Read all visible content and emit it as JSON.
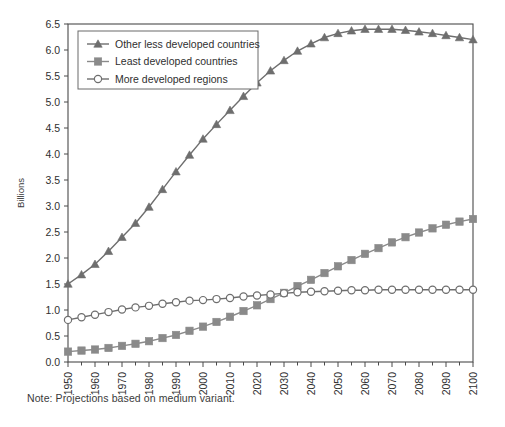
{
  "figure": {
    "note": "Note: Projections based on medium variant.",
    "ylabel": "Billions"
  },
  "legend": {
    "position": "top-left-inside",
    "entries": [
      {
        "label": "Other less developed countries",
        "marker": "triangle",
        "color": "#6e6e6e"
      },
      {
        "label": "Least developed countries",
        "marker": "square",
        "color": "#8a8a8a"
      },
      {
        "label": "More developed regions",
        "marker": "circle-open",
        "color": "#6e6e6e"
      }
    ]
  },
  "axes": {
    "y_ticks": [
      "0.0",
      "0.5",
      "1.0",
      "1.5",
      "2.0",
      "2.5",
      "3.0",
      "3.5",
      "4.0",
      "4.5",
      "5.0",
      "5.5",
      "6.0",
      "6.5"
    ],
    "x_ticks": [
      "1950",
      "1960",
      "1970",
      "1980",
      "1990",
      "2000",
      "2010",
      "2020",
      "2030",
      "2040",
      "2050",
      "2060",
      "2070",
      "2080",
      "2090",
      "2100"
    ]
  },
  "chart_data": {
    "type": "line",
    "title": "",
    "xlabel": "",
    "ylabel": "Billions",
    "xlim": [
      1950,
      2100
    ],
    "ylim": [
      0.0,
      6.5
    ],
    "grid": false,
    "legend_position": "upper left",
    "x": [
      1950,
      1955,
      1960,
      1965,
      1970,
      1975,
      1980,
      1985,
      1990,
      1995,
      2000,
      2005,
      2010,
      2015,
      2020,
      2025,
      2030,
      2035,
      2040,
      2045,
      2050,
      2055,
      2060,
      2065,
      2070,
      2075,
      2080,
      2085,
      2090,
      2095,
      2100
    ],
    "series": [
      {
        "name": "Other less developed countries",
        "marker": "triangle",
        "color": "#6e6e6e",
        "values": [
          1.5,
          1.68,
          1.88,
          2.13,
          2.4,
          2.67,
          2.98,
          3.32,
          3.66,
          3.98,
          4.29,
          4.57,
          4.84,
          5.11,
          5.37,
          5.6,
          5.8,
          5.98,
          6.12,
          6.24,
          6.32,
          6.37,
          6.4,
          6.4,
          6.4,
          6.38,
          6.35,
          6.32,
          6.28,
          6.24,
          6.2
        ]
      },
      {
        "name": "Least developed countries",
        "marker": "square",
        "color": "#8a8a8a",
        "values": [
          0.2,
          0.22,
          0.24,
          0.27,
          0.31,
          0.35,
          0.4,
          0.46,
          0.52,
          0.6,
          0.68,
          0.77,
          0.87,
          0.98,
          1.09,
          1.21,
          1.33,
          1.46,
          1.58,
          1.71,
          1.84,
          1.96,
          2.08,
          2.19,
          2.3,
          2.4,
          2.49,
          2.57,
          2.64,
          2.7,
          2.75
        ]
      },
      {
        "name": "More developed regions",
        "marker": "circle-open",
        "color": "#6e6e6e",
        "values": [
          0.81,
          0.86,
          0.91,
          0.96,
          1.01,
          1.05,
          1.08,
          1.12,
          1.15,
          1.18,
          1.19,
          1.21,
          1.23,
          1.26,
          1.28,
          1.3,
          1.32,
          1.34,
          1.35,
          1.36,
          1.37,
          1.38,
          1.38,
          1.39,
          1.39,
          1.39,
          1.39,
          1.39,
          1.39,
          1.39,
          1.39
        ]
      }
    ]
  }
}
